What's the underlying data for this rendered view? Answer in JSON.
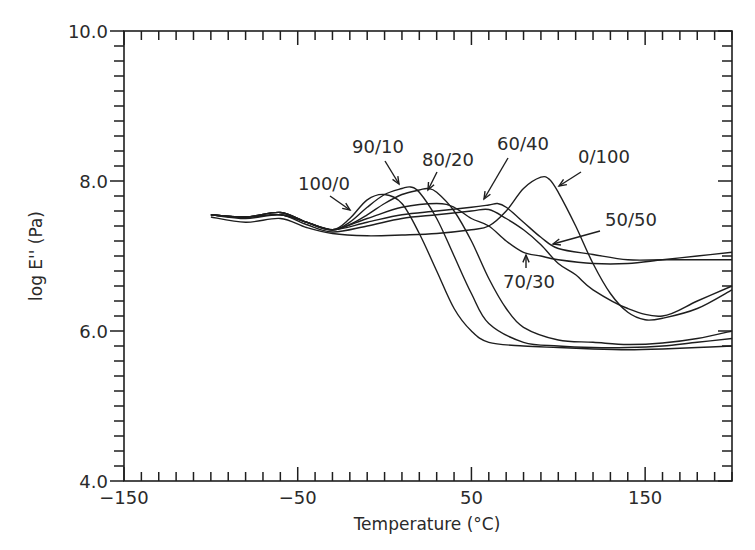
{
  "chart_data": {
    "type": "line",
    "title": "",
    "xlabel": "Temperature  (°C)",
    "ylabel": "log  E''  (Pa)",
    "xlim": [
      -150,
      200
    ],
    "ylim": [
      4.0,
      10.0
    ],
    "x_ticks": [
      -150,
      -50,
      50,
      150
    ],
    "x_tick_labels": [
      "−150",
      "−50",
      "50",
      "150"
    ],
    "y_ticks": [
      4.0,
      6.0,
      8.0,
      10.0
    ],
    "y_tick_labels": [
      "4.0",
      "6.0",
      "8.0",
      "10.0"
    ],
    "x_minor_step": 10,
    "y_minor_step": 0.2,
    "grid": false,
    "legend": "inline annotations with arrows",
    "series": [
      {
        "name": "100/0",
        "x": [
          -100,
          -80,
          -60,
          -45,
          -30,
          -20,
          -10,
          0,
          10,
          20,
          30,
          40,
          50,
          60,
          80,
          100,
          120,
          140,
          160,
          180,
          200
        ],
        "y": [
          7.55,
          7.52,
          7.55,
          7.45,
          7.35,
          7.5,
          7.75,
          7.82,
          7.7,
          7.3,
          6.8,
          6.3,
          6.0,
          5.85,
          5.8,
          5.78,
          5.76,
          5.75,
          5.76,
          5.78,
          5.8
        ]
      },
      {
        "name": "90/10",
        "x": [
          -100,
          -80,
          -60,
          -45,
          -30,
          -20,
          -10,
          0,
          10,
          15,
          20,
          30,
          40,
          50,
          60,
          80,
          100,
          120,
          140,
          160,
          180,
          200
        ],
        "y": [
          7.55,
          7.52,
          7.55,
          7.45,
          7.35,
          7.45,
          7.65,
          7.82,
          7.9,
          7.92,
          7.85,
          7.5,
          7.0,
          6.5,
          6.1,
          5.85,
          5.8,
          5.78,
          5.78,
          5.8,
          5.85,
          5.9
        ]
      },
      {
        "name": "80/20",
        "x": [
          -100,
          -80,
          -60,
          -45,
          -30,
          -20,
          -10,
          0,
          10,
          20,
          25,
          30,
          40,
          50,
          60,
          70,
          80,
          100,
          120,
          140,
          160,
          180,
          200
        ],
        "y": [
          7.55,
          7.52,
          7.58,
          7.45,
          7.35,
          7.42,
          7.55,
          7.7,
          7.82,
          7.88,
          7.9,
          7.85,
          7.6,
          7.2,
          6.7,
          6.3,
          6.05,
          5.88,
          5.85,
          5.82,
          5.84,
          5.9,
          6.0
        ]
      },
      {
        "name": "70/30",
        "x": [
          -100,
          -80,
          -60,
          -45,
          -30,
          -10,
          10,
          30,
          40,
          50,
          60,
          70,
          80,
          90,
          100,
          120,
          140,
          160,
          180,
          200
        ],
        "y": [
          7.55,
          7.52,
          7.58,
          7.45,
          7.35,
          7.5,
          7.65,
          7.7,
          7.65,
          7.5,
          7.4,
          7.2,
          7.05,
          7.0,
          6.95,
          6.9,
          6.9,
          6.95,
          7.0,
          7.05
        ]
      },
      {
        "name": "60/40",
        "x": [
          -100,
          -80,
          -60,
          -45,
          -30,
          -10,
          10,
          30,
          50,
          60,
          65,
          70,
          80,
          90,
          100,
          120,
          140,
          160,
          180,
          200
        ],
        "y": [
          7.55,
          7.52,
          7.58,
          7.45,
          7.35,
          7.45,
          7.55,
          7.6,
          7.65,
          7.68,
          7.7,
          7.65,
          7.45,
          7.25,
          7.1,
          7.02,
          6.95,
          6.95,
          6.95,
          6.95
        ]
      },
      {
        "name": "50/50",
        "x": [
          -100,
          -80,
          -60,
          -45,
          -30,
          -10,
          10,
          30,
          50,
          60,
          70,
          80,
          90,
          100,
          110,
          120,
          140,
          160,
          180,
          200
        ],
        "y": [
          7.55,
          7.5,
          7.55,
          7.42,
          7.32,
          7.4,
          7.5,
          7.55,
          7.6,
          7.62,
          7.5,
          7.35,
          7.15,
          6.9,
          6.75,
          6.55,
          6.3,
          6.2,
          6.4,
          6.6
        ]
      },
      {
        "name": "0/100",
        "x": [
          -100,
          -80,
          -60,
          -45,
          -30,
          -10,
          10,
          30,
          50,
          60,
          70,
          80,
          90,
          95,
          100,
          110,
          120,
          130,
          140,
          150,
          160,
          180,
          200
        ],
        "y": [
          7.52,
          7.45,
          7.5,
          7.38,
          7.3,
          7.27,
          7.28,
          7.3,
          7.35,
          7.4,
          7.6,
          7.9,
          8.05,
          8.02,
          7.85,
          7.4,
          6.9,
          6.5,
          6.25,
          6.15,
          6.17,
          6.3,
          6.55
        ]
      }
    ],
    "annotations": [
      {
        "text": "100/0",
        "points_to": [
          -15,
          7.6
        ]
      },
      {
        "text": "90/10",
        "points_to": [
          15,
          7.92
        ]
      },
      {
        "text": "80/20",
        "points_to": [
          25,
          7.88
        ]
      },
      {
        "text": "60/40",
        "points_to": [
          55,
          7.7
        ]
      },
      {
        "text": "0/100",
        "points_to": [
          95,
          7.98
        ]
      },
      {
        "text": "50/50",
        "points_to": [
          115,
          7.1
        ]
      },
      {
        "text": "70/30",
        "points_to": [
          85,
          7.05
        ]
      }
    ]
  }
}
